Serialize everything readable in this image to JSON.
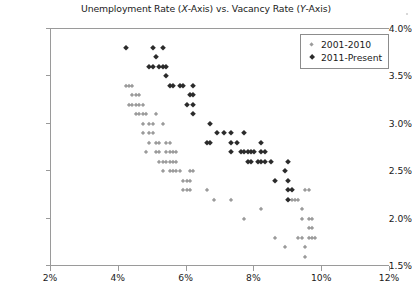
{
  "chart_data": {
    "type": "scatter",
    "title": "Unemployment Rate (X-Axis) vs. Vacancy Rate (Y-Axis)",
    "title_parts": {
      "a": "Unemployment Rate (",
      "x_italic": "X",
      "b": "-Axis) vs. Vacancy Rate (",
      "y_italic": "Y",
      "c": "-Axis)"
    },
    "xlabel": "",
    "ylabel": "",
    "xlim": [
      2,
      12
    ],
    "ylim": [
      1.5,
      4.0
    ],
    "xticks": [
      2,
      4,
      6,
      8,
      10,
      12
    ],
    "xtick_labels": [
      "2%",
      "4%",
      "6%",
      "8%",
      "10%",
      "12%"
    ],
    "yticks": [
      1.5,
      2.0,
      2.5,
      3.0,
      3.5,
      4.0
    ],
    "ytick_labels": [
      "1.5%",
      "2.0%",
      "2.5%",
      "3.0%",
      "3.5%",
      "4.0%"
    ],
    "grid": false,
    "legend_position": "top-right",
    "series": [
      {
        "name": "2001-2010",
        "marker": "diamond",
        "color": "#9b9b9b",
        "size": "small",
        "points": [
          [
            4.2,
            3.4
          ],
          [
            4.3,
            3.4
          ],
          [
            4.4,
            3.4
          ],
          [
            4.4,
            3.3
          ],
          [
            4.5,
            3.3
          ],
          [
            4.6,
            3.3
          ],
          [
            4.3,
            3.2
          ],
          [
            4.4,
            3.2
          ],
          [
            4.5,
            3.2
          ],
          [
            4.6,
            3.2
          ],
          [
            4.7,
            3.2
          ],
          [
            4.5,
            3.1
          ],
          [
            4.6,
            3.1
          ],
          [
            4.7,
            3.1
          ],
          [
            4.8,
            3.1
          ],
          [
            5.1,
            3.1
          ],
          [
            4.7,
            3.0
          ],
          [
            4.9,
            3.0
          ],
          [
            5.0,
            3.0
          ],
          [
            5.3,
            3.0
          ],
          [
            4.7,
            2.9
          ],
          [
            4.9,
            2.9
          ],
          [
            5.0,
            2.9
          ],
          [
            4.9,
            2.8
          ],
          [
            5.1,
            2.8
          ],
          [
            5.2,
            2.8
          ],
          [
            5.4,
            2.8
          ],
          [
            5.5,
            2.8
          ],
          [
            4.8,
            2.7
          ],
          [
            5.1,
            2.7
          ],
          [
            5.2,
            2.7
          ],
          [
            5.4,
            2.7
          ],
          [
            5.5,
            2.7
          ],
          [
            5.6,
            2.7
          ],
          [
            5.7,
            2.7
          ],
          [
            5.2,
            2.6
          ],
          [
            5.3,
            2.6
          ],
          [
            5.4,
            2.6
          ],
          [
            5.5,
            2.6
          ],
          [
            5.6,
            2.6
          ],
          [
            5.7,
            2.6
          ],
          [
            5.3,
            2.5
          ],
          [
            5.5,
            2.5
          ],
          [
            5.6,
            2.5
          ],
          [
            5.7,
            2.5
          ],
          [
            5.8,
            2.5
          ],
          [
            6.1,
            2.5
          ],
          [
            6.2,
            2.5
          ],
          [
            5.9,
            2.4
          ],
          [
            6.0,
            2.4
          ],
          [
            6.1,
            2.4
          ],
          [
            5.9,
            2.3
          ],
          [
            6.0,
            2.3
          ],
          [
            6.1,
            2.3
          ],
          [
            6.6,
            2.3
          ],
          [
            9.1,
            2.3
          ],
          [
            9.5,
            2.3
          ],
          [
            9.6,
            2.3
          ],
          [
            6.8,
            2.2
          ],
          [
            7.3,
            2.2
          ],
          [
            9.0,
            2.2
          ],
          [
            9.1,
            2.2
          ],
          [
            9.2,
            2.2
          ],
          [
            9.3,
            2.2
          ],
          [
            8.2,
            2.1
          ],
          [
            9.4,
            2.1
          ],
          [
            7.7,
            2.0
          ],
          [
            9.4,
            2.0
          ],
          [
            9.6,
            2.0
          ],
          [
            9.7,
            2.0
          ],
          [
            9.6,
            1.9
          ],
          [
            9.7,
            1.9
          ],
          [
            8.6,
            1.8
          ],
          [
            9.3,
            1.8
          ],
          [
            9.4,
            1.8
          ],
          [
            9.6,
            1.8
          ],
          [
            9.7,
            1.8
          ],
          [
            9.8,
            1.8
          ],
          [
            8.9,
            1.7
          ],
          [
            9.5,
            1.7
          ],
          [
            9.5,
            1.6
          ]
        ]
      },
      {
        "name": "2011-Present",
        "marker": "diamond",
        "color": "#2b2b2b",
        "size": "large",
        "points": [
          [
            4.2,
            3.8
          ],
          [
            5.0,
            3.8
          ],
          [
            5.3,
            3.8
          ],
          [
            5.1,
            3.7
          ],
          [
            4.9,
            3.6
          ],
          [
            5.0,
            3.6
          ],
          [
            5.2,
            3.6
          ],
          [
            5.3,
            3.6
          ],
          [
            5.4,
            3.6
          ],
          [
            5.4,
            3.5
          ],
          [
            5.5,
            3.4
          ],
          [
            5.6,
            3.4
          ],
          [
            5.8,
            3.4
          ],
          [
            5.9,
            3.4
          ],
          [
            6.2,
            3.4
          ],
          [
            6.1,
            3.3
          ],
          [
            6.2,
            3.3
          ],
          [
            6.0,
            3.2
          ],
          [
            6.2,
            3.2
          ],
          [
            6.2,
            3.1
          ],
          [
            6.7,
            3.0
          ],
          [
            6.9,
            2.9
          ],
          [
            7.1,
            2.9
          ],
          [
            7.3,
            2.9
          ],
          [
            7.7,
            2.9
          ],
          [
            6.6,
            2.8
          ],
          [
            6.7,
            2.8
          ],
          [
            7.3,
            2.8
          ],
          [
            7.5,
            2.8
          ],
          [
            8.2,
            2.8
          ],
          [
            7.3,
            2.7
          ],
          [
            7.6,
            2.7
          ],
          [
            7.7,
            2.7
          ],
          [
            7.8,
            2.7
          ],
          [
            7.9,
            2.7
          ],
          [
            8.0,
            2.7
          ],
          [
            8.2,
            2.7
          ],
          [
            8.3,
            2.7
          ],
          [
            7.8,
            2.6
          ],
          [
            7.9,
            2.6
          ],
          [
            8.1,
            2.6
          ],
          [
            8.2,
            2.6
          ],
          [
            8.3,
            2.6
          ],
          [
            8.5,
            2.6
          ],
          [
            9.0,
            2.6
          ],
          [
            8.9,
            2.5
          ],
          [
            8.6,
            2.4
          ],
          [
            9.0,
            2.4
          ],
          [
            9.0,
            2.3
          ],
          [
            9.1,
            2.3
          ],
          [
            9.0,
            2.2
          ]
        ]
      }
    ]
  }
}
